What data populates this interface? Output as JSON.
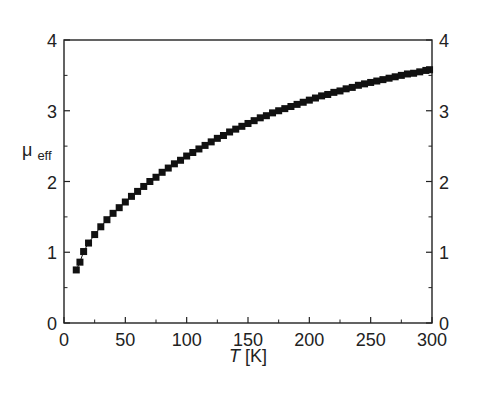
{
  "chart_data": {
    "type": "scatter",
    "title": "",
    "xlabel": "T [K]",
    "xlabel_italic_part": "T",
    "xlabel_unit": "[K]",
    "ylabel": "μeff",
    "ylabel_main": "μ",
    "ylabel_sub": "eff",
    "xlim": [
      0,
      300
    ],
    "ylim": [
      0,
      4
    ],
    "x_ticks": [
      0,
      50,
      100,
      150,
      200,
      250,
      300
    ],
    "y_ticks": [
      0,
      1,
      2,
      3,
      4
    ],
    "y_ticks_right": [
      0,
      1,
      2,
      3,
      4
    ],
    "grid": false,
    "legend": null,
    "marker": "filled-square",
    "marker_color": "#111111",
    "connected_line": true,
    "series": [
      {
        "name": "μeff",
        "x": [
          10,
          13,
          16,
          20,
          25,
          30,
          35,
          40,
          45,
          50,
          55,
          60,
          65,
          70,
          75,
          80,
          85,
          90,
          95,
          100,
          105,
          110,
          115,
          120,
          125,
          130,
          135,
          140,
          145,
          150,
          155,
          160,
          165,
          170,
          175,
          180,
          185,
          190,
          195,
          200,
          205,
          210,
          215,
          220,
          225,
          230,
          235,
          240,
          245,
          250,
          255,
          260,
          265,
          270,
          275,
          280,
          285,
          290,
          295,
          298
        ],
        "y": [
          0.75,
          0.86,
          1.01,
          1.13,
          1.25,
          1.36,
          1.46,
          1.55,
          1.63,
          1.71,
          1.79,
          1.86,
          1.93,
          2.0,
          2.06,
          2.13,
          2.19,
          2.25,
          2.3,
          2.36,
          2.41,
          2.46,
          2.51,
          2.56,
          2.61,
          2.65,
          2.7,
          2.74,
          2.78,
          2.82,
          2.86,
          2.9,
          2.93,
          2.97,
          3.0,
          3.03,
          3.06,
          3.09,
          3.12,
          3.15,
          3.18,
          3.21,
          3.23,
          3.26,
          3.28,
          3.31,
          3.33,
          3.36,
          3.38,
          3.4,
          3.42,
          3.44,
          3.46,
          3.48,
          3.5,
          3.52,
          3.53,
          3.55,
          3.57,
          3.58
        ]
      }
    ]
  },
  "colors": {
    "axis": "#222222",
    "marker": "#111111",
    "background": "#ffffff"
  }
}
